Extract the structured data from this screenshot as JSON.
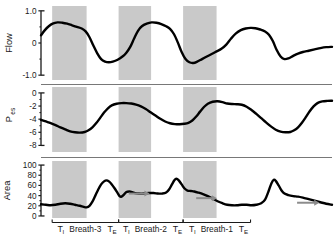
{
  "figure": {
    "caption": "",
    "background": "#ffffff",
    "trace_color": "#000000",
    "band_color": "#c9c9c9",
    "arrow_color": "#8c8c8c",
    "axis_color": "#1a1a1a"
  },
  "xaxis": {
    "breath_labels": [
      {
        "ti": "T",
        "ti_sub": "I",
        "name": "Breath-3",
        "te": "T",
        "te_sub": "E"
      },
      {
        "ti": "T",
        "ti_sub": "I",
        "name": "Breath-2",
        "te": "T",
        "te_sub": "E"
      },
      {
        "ti": "T",
        "ti_sub": "I",
        "name": "Breath-1",
        "te": "T",
        "te_sub": "E"
      }
    ]
  },
  "panels": [
    {
      "key": "flow",
      "label": "Flow",
      "label_sub": "",
      "ticks": [
        "1.0",
        "0",
        "-1.0"
      ],
      "tick_values": [
        1.0,
        0,
        -1.0
      ],
      "ylim": [
        -1.15,
        1.15
      ],
      "minor_ticks": [
        0.5,
        -0.5
      ]
    },
    {
      "key": "pes",
      "label": "P",
      "label_sub": "es",
      "ticks": [
        "0",
        "-2",
        "-4",
        "-6",
        "-8"
      ],
      "tick_values": [
        0,
        -2,
        -4,
        -6,
        -8
      ],
      "ylim": [
        -9.0,
        0.9
      ],
      "minor_ticks": [
        -1,
        -3,
        -5,
        -7
      ]
    },
    {
      "key": "area",
      "label": "Area",
      "label_sub": "",
      "ticks": [
        "100",
        "80",
        "60",
        "40",
        "20",
        "0"
      ],
      "tick_values": [
        100,
        80,
        60,
        40,
        20,
        0
      ],
      "ylim": [
        -4,
        108
      ],
      "minor_ticks": [
        90,
        70,
        50,
        30,
        10
      ]
    }
  ],
  "chart_data": {
    "type": "line",
    "title": "",
    "xlabel": "",
    "ylabel": "",
    "grid": false,
    "legend": false,
    "x_range": [
      0,
      3.0
    ],
    "inspiration_bands": [
      {
        "breath": "Breath-3",
        "start": 0.115,
        "end": 0.47
      },
      {
        "breath": "Breath-2",
        "start": 0.8,
        "end": 1.135
      },
      {
        "breath": "Breath-1",
        "start": 1.465,
        "end": 1.81
      }
    ],
    "breath_label_spans": [
      {
        "label": "Breath-3",
        "start": 0.115,
        "end": 0.8
      },
      {
        "label": "Breath-2",
        "start": 0.8,
        "end": 1.465
      },
      {
        "label": "Breath-1",
        "start": 1.465,
        "end": 2.16
      }
    ],
    "series": [
      {
        "name": "Flow",
        "panel": "flow",
        "units": "L/s",
        "points": [
          [
            0.0,
            0.24
          ],
          [
            0.04,
            0.4
          ],
          [
            0.08,
            0.52
          ],
          [
            0.12,
            0.6
          ],
          [
            0.17,
            0.64
          ],
          [
            0.22,
            0.63
          ],
          [
            0.27,
            0.6
          ],
          [
            0.32,
            0.55
          ],
          [
            0.37,
            0.5
          ],
          [
            0.42,
            0.45
          ],
          [
            0.46,
            0.36
          ],
          [
            0.5,
            0.18
          ],
          [
            0.54,
            -0.08
          ],
          [
            0.58,
            -0.32
          ],
          [
            0.62,
            -0.5
          ],
          [
            0.66,
            -0.58
          ],
          [
            0.7,
            -0.6
          ],
          [
            0.74,
            -0.58
          ],
          [
            0.79,
            -0.52
          ],
          [
            0.84,
            -0.42
          ],
          [
            0.88,
            -0.3
          ],
          [
            0.92,
            -0.12
          ],
          [
            0.96,
            0.14
          ],
          [
            1.0,
            0.38
          ],
          [
            1.04,
            0.52
          ],
          [
            1.09,
            0.6
          ],
          [
            1.14,
            0.64
          ],
          [
            1.19,
            0.63
          ],
          [
            1.24,
            0.59
          ],
          [
            1.29,
            0.52
          ],
          [
            1.33,
            0.44
          ],
          [
            1.37,
            0.28
          ],
          [
            1.41,
            0.02
          ],
          [
            1.45,
            -0.28
          ],
          [
            1.49,
            -0.5
          ],
          [
            1.53,
            -0.6
          ],
          [
            1.57,
            -0.62
          ],
          [
            1.61,
            -0.58
          ],
          [
            1.66,
            -0.5
          ],
          [
            1.71,
            -0.42
          ],
          [
            1.76,
            -0.34
          ],
          [
            1.81,
            -0.26
          ],
          [
            1.86,
            -0.18
          ],
          [
            1.91,
            -0.05
          ],
          [
            1.96,
            0.14
          ],
          [
            2.01,
            0.3
          ],
          [
            2.06,
            0.4
          ],
          [
            2.11,
            0.45
          ],
          [
            2.16,
            0.47
          ],
          [
            2.21,
            0.46
          ],
          [
            2.26,
            0.42
          ],
          [
            2.31,
            0.36
          ],
          [
            2.35,
            0.26
          ],
          [
            2.39,
            0.06
          ],
          [
            2.43,
            -0.22
          ],
          [
            2.47,
            -0.42
          ],
          [
            2.51,
            -0.5
          ],
          [
            2.55,
            -0.48
          ],
          [
            2.6,
            -0.4
          ],
          [
            2.65,
            -0.33
          ],
          [
            2.7,
            -0.28
          ],
          [
            2.76,
            -0.24
          ],
          [
            2.82,
            -0.2
          ],
          [
            2.88,
            -0.16
          ],
          [
            2.94,
            -0.13
          ],
          [
            3.0,
            -0.12
          ]
        ]
      },
      {
        "name": "Pes",
        "panel": "pes",
        "units": "cmH2O",
        "points": [
          [
            0.0,
            -4.1
          ],
          [
            0.05,
            -4.35
          ],
          [
            0.1,
            -4.6
          ],
          [
            0.15,
            -4.9
          ],
          [
            0.2,
            -5.25
          ],
          [
            0.25,
            -5.55
          ],
          [
            0.3,
            -5.85
          ],
          [
            0.35,
            -6.0
          ],
          [
            0.4,
            -6.05
          ],
          [
            0.45,
            -5.95
          ],
          [
            0.49,
            -5.7
          ],
          [
            0.53,
            -5.25
          ],
          [
            0.57,
            -4.6
          ],
          [
            0.61,
            -3.8
          ],
          [
            0.65,
            -3.0
          ],
          [
            0.69,
            -2.35
          ],
          [
            0.73,
            -1.9
          ],
          [
            0.78,
            -1.65
          ],
          [
            0.83,
            -1.55
          ],
          [
            0.88,
            -1.55
          ],
          [
            0.93,
            -1.62
          ],
          [
            0.98,
            -1.78
          ],
          [
            1.03,
            -2.05
          ],
          [
            1.08,
            -2.45
          ],
          [
            1.13,
            -2.95
          ],
          [
            1.18,
            -3.45
          ],
          [
            1.23,
            -3.95
          ],
          [
            1.28,
            -4.35
          ],
          [
            1.33,
            -4.62
          ],
          [
            1.38,
            -4.75
          ],
          [
            1.43,
            -4.78
          ],
          [
            1.48,
            -4.7
          ],
          [
            1.52,
            -4.55
          ],
          [
            1.56,
            -4.2
          ],
          [
            1.6,
            -3.6
          ],
          [
            1.64,
            -2.85
          ],
          [
            1.68,
            -2.15
          ],
          [
            1.72,
            -1.65
          ],
          [
            1.77,
            -1.35
          ],
          [
            1.82,
            -1.28
          ],
          [
            1.87,
            -1.4
          ],
          [
            1.92,
            -1.62
          ],
          [
            1.97,
            -1.7
          ],
          [
            2.02,
            -1.72
          ],
          [
            2.07,
            -1.8
          ],
          [
            2.12,
            -2.1
          ],
          [
            2.17,
            -2.6
          ],
          [
            2.22,
            -3.2
          ],
          [
            2.27,
            -3.85
          ],
          [
            2.32,
            -4.5
          ],
          [
            2.37,
            -5.1
          ],
          [
            2.42,
            -5.6
          ],
          [
            2.47,
            -5.9
          ],
          [
            2.52,
            -6.0
          ],
          [
            2.57,
            -5.95
          ],
          [
            2.61,
            -5.7
          ],
          [
            2.65,
            -5.25
          ],
          [
            2.69,
            -4.55
          ],
          [
            2.73,
            -3.7
          ],
          [
            2.77,
            -2.8
          ],
          [
            2.81,
            -2.05
          ],
          [
            2.85,
            -1.55
          ],
          [
            2.9,
            -1.3
          ],
          [
            2.95,
            -1.22
          ],
          [
            3.0,
            -1.2
          ]
        ]
      },
      {
        "name": "Area",
        "panel": "area",
        "units": "mm2",
        "points": [
          [
            0.0,
            23
          ],
          [
            0.05,
            22
          ],
          [
            0.1,
            21
          ],
          [
            0.15,
            22
          ],
          [
            0.2,
            24
          ],
          [
            0.25,
            25
          ],
          [
            0.3,
            24
          ],
          [
            0.35,
            22
          ],
          [
            0.4,
            20
          ],
          [
            0.44,
            18
          ],
          [
            0.47,
            17
          ],
          [
            0.5,
            20
          ],
          [
            0.53,
            28
          ],
          [
            0.56,
            40
          ],
          [
            0.59,
            52
          ],
          [
            0.62,
            62
          ],
          [
            0.65,
            68
          ],
          [
            0.675,
            70
          ],
          [
            0.7,
            68
          ],
          [
            0.73,
            62
          ],
          [
            0.76,
            54
          ],
          [
            0.79,
            45
          ],
          [
            0.81,
            39
          ],
          [
            0.83,
            38
          ],
          [
            0.855,
            42
          ],
          [
            0.88,
            47
          ],
          [
            0.91,
            48
          ],
          [
            0.94,
            47
          ],
          [
            0.97,
            45
          ],
          [
            1.01,
            44
          ],
          [
            1.06,
            44
          ],
          [
            1.11,
            45
          ],
          [
            1.16,
            45
          ],
          [
            1.21,
            44
          ],
          [
            1.25,
            44
          ],
          [
            1.29,
            46
          ],
          [
            1.32,
            52
          ],
          [
            1.35,
            62
          ],
          [
            1.375,
            70
          ],
          [
            1.395,
            73
          ],
          [
            1.42,
            70
          ],
          [
            1.45,
            62
          ],
          [
            1.48,
            54
          ],
          [
            1.51,
            50
          ],
          [
            1.545,
            49
          ],
          [
            1.58,
            48
          ],
          [
            1.62,
            46
          ],
          [
            1.67,
            43
          ],
          [
            1.72,
            39
          ],
          [
            1.77,
            34
          ],
          [
            1.82,
            29
          ],
          [
            1.87,
            25
          ],
          [
            1.92,
            22
          ],
          [
            1.97,
            21
          ],
          [
            2.02,
            21
          ],
          [
            2.07,
            22
          ],
          [
            2.12,
            22
          ],
          [
            2.17,
            21
          ],
          [
            2.22,
            22
          ],
          [
            2.27,
            25
          ],
          [
            2.31,
            32
          ],
          [
            2.345,
            48
          ],
          [
            2.375,
            64
          ],
          [
            2.4,
            71
          ],
          [
            2.42,
            69
          ],
          [
            2.45,
            60
          ],
          [
            2.48,
            50
          ],
          [
            2.51,
            44
          ],
          [
            2.55,
            41
          ],
          [
            2.6,
            39
          ],
          [
            2.65,
            38
          ],
          [
            2.7,
            36
          ],
          [
            2.76,
            33
          ],
          [
            2.82,
            30
          ],
          [
            2.88,
            27
          ],
          [
            2.94,
            24
          ],
          [
            3.0,
            22
          ]
        ]
      }
    ],
    "annotations": [
      {
        "type": "arrow",
        "panel": "area",
        "x_start": 0.905,
        "x_end": 1.12,
        "y": 44,
        "direction": "right"
      },
      {
        "type": "arrow",
        "panel": "area",
        "x_start": 1.6,
        "x_end": 1.815,
        "y": 35,
        "direction": "right"
      },
      {
        "type": "arrow",
        "panel": "area",
        "x_start": 2.64,
        "x_end": 2.87,
        "y": 26,
        "direction": "right"
      }
    ]
  }
}
